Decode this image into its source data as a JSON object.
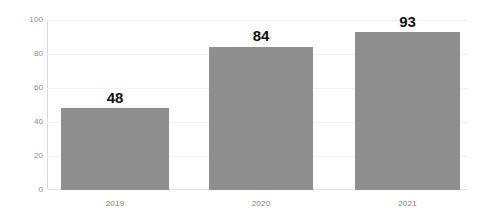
{
  "chart_data": {
    "type": "bar",
    "title": "",
    "subtitle": "",
    "xlabel": "",
    "ylabel": "",
    "categories": [
      "2019",
      "2020",
      "2021"
    ],
    "values": [
      48,
      84,
      93
    ],
    "data_labels": [
      "48",
      "84",
      "93"
    ],
    "ylim": [
      0,
      100
    ],
    "y_ticks": [
      "0",
      "20",
      "40",
      "60",
      "80",
      "100"
    ],
    "y_tick_values": [
      0,
      20,
      40,
      60,
      80,
      100
    ],
    "grid": "horizontal",
    "legend": "none",
    "series": [
      {
        "name": "",
        "values": [
          48,
          84,
          93
        ]
      }
    ],
    "colors": {
      "bar": "#8e8e8e",
      "background": "#ffffff",
      "gridline": "#f2f2f2",
      "axis": "#d9d9d9",
      "baseline": "#e3e3e3",
      "tick_label": "#8a8a8a",
      "category_label": "#7d7d7d",
      "value_label": "#111111"
    }
  }
}
